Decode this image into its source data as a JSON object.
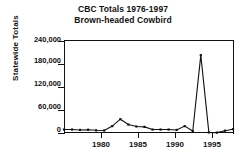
{
  "chart_data": {
    "type": "line",
    "title": "CBC Totals 1976-1997",
    "subtitle": "Brown-headed Cowbird",
    "xlabel": "",
    "ylabel": "Statewide Totals",
    "ylim": [
      0,
      240000
    ],
    "xlim": [
      1976,
      1997
    ],
    "grid": false,
    "legend": null,
    "marker": "square",
    "line_color": "#111111",
    "ytick_labels": [
      "0",
      "60,000",
      "120,000",
      "180,000",
      "240,000"
    ],
    "ytick_values": [
      0,
      60000,
      120000,
      180000,
      240000
    ],
    "xtick_labels": [
      "1980",
      "1985",
      "1990",
      "1995"
    ],
    "xtick_values": [
      1980,
      1985,
      1990,
      1995
    ],
    "x": [
      1976,
      1977,
      1978,
      1979,
      1980,
      1981,
      1982,
      1983,
      1984,
      1985,
      1986,
      1987,
      1988,
      1989,
      1990,
      1991,
      1992,
      1993,
      1994,
      1995,
      1996,
      1997
    ],
    "values": [
      9000,
      9000,
      8000,
      8500,
      7000,
      6500,
      18000,
      36000,
      22000,
      17000,
      16000,
      9000,
      9000,
      9000,
      8000,
      18000,
      5000,
      203000,
      1500,
      1000,
      6000,
      10000
    ],
    "series": [
      {
        "name": "Brown-headed Cowbird",
        "values": [
          9000,
          9000,
          8000,
          8500,
          7000,
          6500,
          18000,
          36000,
          22000,
          17000,
          16000,
          9000,
          9000,
          9000,
          8000,
          18000,
          5000,
          203000,
          1500,
          1000,
          6000,
          10000
        ]
      }
    ]
  },
  "axis": {
    "ylabel_text": "Statewide Totals"
  }
}
